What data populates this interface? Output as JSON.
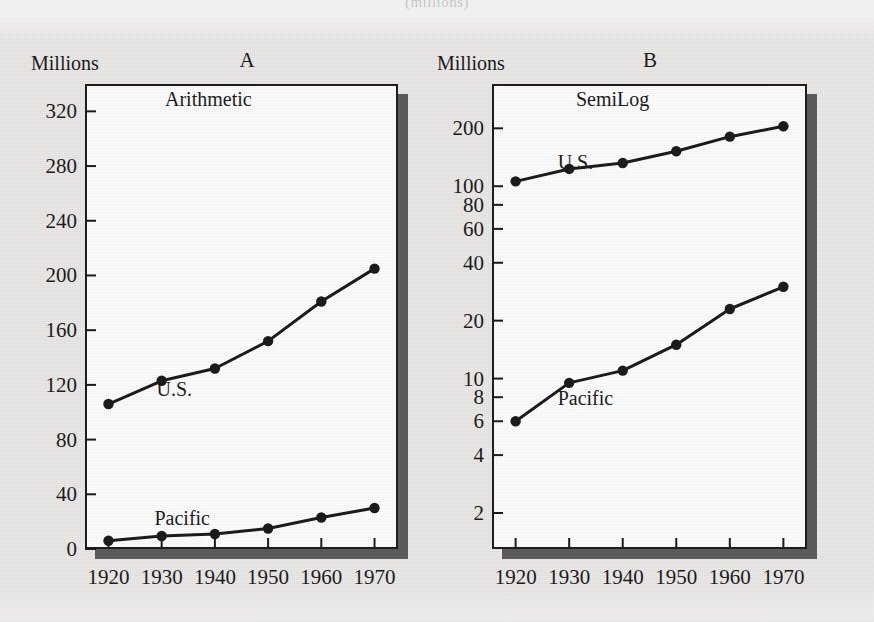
{
  "figure": {
    "cut_caption": "(millions)",
    "background_color": "#ebeae8",
    "ink_color": "#1c1c1c",
    "shadow_color": "#5d5d5d"
  },
  "panels": [
    {
      "letter": "A",
      "plot_title": "Arithmetic",
      "axis_title": "Millions",
      "scale": "linear",
      "y_ticks": [
        "0",
        "40",
        "80",
        "120",
        "160",
        "200",
        "240",
        "280",
        "320"
      ],
      "x_ticks": [
        "1920",
        "1930",
        "1940",
        "1950",
        "1960",
        "1970"
      ],
      "series_labels": [
        "U.S.",
        "Pacific"
      ]
    },
    {
      "letter": "B",
      "plot_title": "SemiLog",
      "axis_title": "Millions",
      "scale": "log",
      "y_ticks": [
        "2",
        "4",
        "6",
        "8",
        "10",
        "20",
        "40",
        "60",
        "80",
        "100",
        "200"
      ],
      "x_ticks": [
        "1920",
        "1930",
        "1940",
        "1950",
        "1960",
        "1970"
      ],
      "series_labels": [
        "U.S.",
        "Pacific"
      ]
    }
  ],
  "chart_data": [
    {
      "type": "line",
      "panel": "A",
      "title": "Arithmetic",
      "xlabel": "",
      "ylabel": "Millions",
      "yscale": "linear",
      "ylim": [
        0,
        340
      ],
      "yticks": [
        0,
        40,
        80,
        120,
        160,
        200,
        240,
        280,
        320
      ],
      "grid": false,
      "legend": "inline-labels",
      "categories": [
        1920,
        1930,
        1940,
        1950,
        1960,
        1970
      ],
      "series": [
        {
          "name": "U.S.",
          "values": [
            106,
            123,
            132,
            152,
            181,
            205
          ]
        },
        {
          "name": "Pacific",
          "values": [
            6,
            9.5,
            11,
            15,
            23,
            30
          ]
        }
      ]
    },
    {
      "type": "line",
      "panel": "B",
      "title": "SemiLog",
      "xlabel": "",
      "ylabel": "Millions",
      "yscale": "log",
      "ylim": [
        1.3,
        340
      ],
      "yticks": [
        2,
        4,
        6,
        8,
        10,
        20,
        40,
        60,
        80,
        100,
        200
      ],
      "grid": false,
      "legend": "inline-labels",
      "categories": [
        1920,
        1930,
        1940,
        1950,
        1960,
        1970
      ],
      "series": [
        {
          "name": "U.S.",
          "values": [
            106,
            123,
            132,
            152,
            181,
            205
          ]
        },
        {
          "name": "Pacific",
          "values": [
            6,
            9.5,
            11,
            15,
            23,
            30
          ]
        }
      ]
    }
  ]
}
